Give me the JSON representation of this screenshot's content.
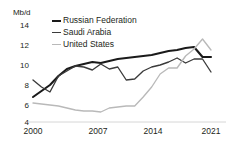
{
  "chart_data": {
    "type": "line",
    "title": "",
    "xlabel": "",
    "ylabel": "Mb/d",
    "unit_label": "Mb/d",
    "grid": false,
    "legend_position": "top-center",
    "xlim": [
      2000,
      2021
    ],
    "ylim": [
      4,
      14
    ],
    "xticks": [
      "2000",
      "2007",
      "2014",
      "2021"
    ],
    "yticks": [
      "4",
      "6",
      "8",
      "10",
      "12",
      "14"
    ],
    "x": [
      2000,
      2001,
      2002,
      2003,
      2004,
      2005,
      2006,
      2007,
      2008,
      2009,
      2010,
      2011,
      2012,
      2013,
      2014,
      2015,
      2016,
      2017,
      2018,
      2019,
      2020,
      2021
    ],
    "series": [
      {
        "name": "Russian Federation",
        "color": "#1a1a1a",
        "width": 2.1,
        "values": [
          6.5,
          7.1,
          7.7,
          8.6,
          9.3,
          9.6,
          9.8,
          10.0,
          9.9,
          10.1,
          10.3,
          10.4,
          10.5,
          10.6,
          10.7,
          10.9,
          11.1,
          11.2,
          11.4,
          11.5,
          10.5,
          10.5
        ]
      },
      {
        "name": "Saudi Arabia",
        "color": "#3b3b3b",
        "width": 1.35,
        "values": [
          8.2,
          7.5,
          7.0,
          8.6,
          9.1,
          9.6,
          9.5,
          9.2,
          9.8,
          9.3,
          9.5,
          8.2,
          8.3,
          9.1,
          9.5,
          9.7,
          10.0,
          10.4,
          9.9,
          10.3,
          10.3,
          9.0
        ]
      },
      {
        "name": "United States",
        "color": "#b9b9b9",
        "width": 1.35,
        "values": [
          5.9,
          5.8,
          5.7,
          5.6,
          5.4,
          5.2,
          5.1,
          5.1,
          5.0,
          5.4,
          5.5,
          5.6,
          5.6,
          6.5,
          7.5,
          8.8,
          9.4,
          9.4,
          10.6,
          11.3,
          12.3,
          11.2
        ]
      }
    ]
  },
  "legend": {
    "items": [
      {
        "label": "Russian Federation"
      },
      {
        "label": "Saudi Arabia"
      },
      {
        "label": "United States"
      }
    ]
  },
  "axes": {
    "unit": "Mb/d",
    "y_labels": [
      "14",
      "12",
      "10",
      "8",
      "6",
      "4"
    ],
    "x_labels": [
      "2000",
      "2007",
      "2014",
      "2021"
    ]
  }
}
